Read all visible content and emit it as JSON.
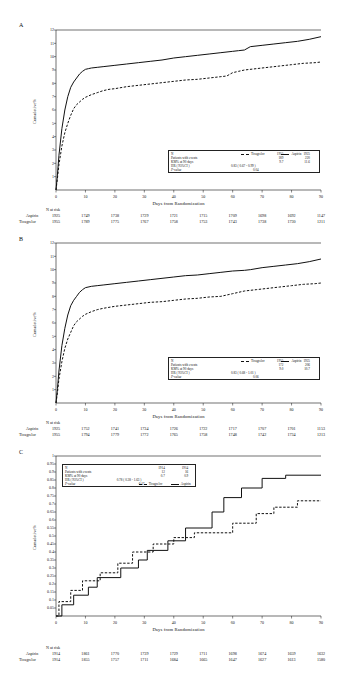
{
  "figure": {
    "xlabel": "Days from Randomization",
    "ylabel": "Cumulative%",
    "risk_header": "N at risk",
    "series_solid": "Aspirin",
    "series_dash": "Ticagrelor",
    "legend_rows": {
      "n": "N",
      "patients": "Patients with events",
      "kmpct": "KM% at 90 days",
      "hr": "HR ( 95%CI )",
      "pvalue": "P-value"
    }
  },
  "panels": [
    {
      "label": "A",
      "yticks": [
        "12",
        "11",
        "10",
        "9",
        "8",
        "7",
        "6",
        "5",
        "4",
        "3",
        "2",
        "1"
      ],
      "xticks": [
        "0",
        "10",
        "20",
        "30",
        "40",
        "50",
        "60",
        "70",
        "80",
        "90"
      ],
      "legend": {
        "n_dash": "1955",
        "n_solid": "1925",
        "events_dash": "189",
        "events_solid": "220",
        "km_dash": "9.7",
        "km_solid": "11.6",
        "hr": "0.83 ( 0.67 - 0.99 )",
        "pvalue": "0.04"
      },
      "risk": {
        "row_solid_label": "Aspirin",
        "row_dash_label": "Ticagrelor",
        "solid": [
          "1925",
          "1749",
          "1738",
          "1729",
          "1721",
          "1715",
          "1709",
          "1698",
          "1692",
          "1147"
        ],
        "dash": [
          "1955",
          "1789",
          "1775",
          "1767",
          "1758",
          "1753",
          "1743",
          "1738",
          "1730",
          "1211"
        ]
      }
    },
    {
      "label": "B",
      "yticks": [
        "12",
        "11",
        "10",
        "9",
        "8",
        "7",
        "6",
        "5",
        "4",
        "3",
        "2",
        "1"
      ],
      "xticks": [
        "0",
        "10",
        "20",
        "30",
        "40",
        "50",
        "60",
        "70",
        "80",
        "90"
      ],
      "legend": {
        "n_dash": "1955",
        "n_solid": "1925",
        "events_dash": "172",
        "events_solid": "206",
        "km_dash": "9.0",
        "km_solid": "10.7",
        "hr": "0.83 ( 0.68 - 1.01 )",
        "pvalue": "0.06"
      },
      "risk": {
        "row_solid_label": "Aspirin",
        "row_dash_label": "Ticagrelor",
        "solid": [
          "1925",
          "1752",
          "1741",
          "1734",
          "1726",
          "1722",
          "1717",
          "1707",
          "1701",
          "1153"
        ],
        "dash": [
          "1955",
          "1794",
          "1779",
          "1772",
          "1765",
          "1758",
          "1748",
          "1742",
          "1734",
          "1213"
        ]
      }
    },
    {
      "label": "C",
      "yticks": [
        "1",
        "0.95",
        "0.9",
        "0.85",
        "0.8",
        "0.75",
        "0.7",
        "0.65",
        "0.6",
        "0.55",
        "0.5",
        "0.45",
        "0.4",
        "0.35",
        "0.3",
        "0.25",
        "0.2",
        "0.15",
        "0.1",
        "0.05"
      ],
      "xticks": [
        "0",
        "10",
        "20",
        "30",
        "40",
        "50",
        "60",
        "70",
        "80",
        "90"
      ],
      "legend": {
        "n_dash": "1914",
        "n_solid": "1914",
        "events_dash": "12",
        "events_solid": "16",
        "km_dash": "0.7",
        "km_solid": "0.9",
        "hr": "0.78 ( 0.38 - 1.63 )",
        "pvalue": "0.47"
      },
      "risk": {
        "row_solid_label": "Aspirin",
        "row_dash_label": "Ticagrelor",
        "solid": [
          "1914",
          "1861",
          "1770",
          "1739",
          "1729",
          "1711",
          "1698",
          "1674",
          "1659",
          "1632"
        ],
        "dash": [
          "1914",
          "1855",
          "1757",
          "1711",
          "1684",
          "1665",
          "1647",
          "1627",
          "1613",
          "1580"
        ]
      }
    }
  ],
  "chart_data": {
    "type": "line",
    "title": "",
    "xlabel": "Days from Randomization",
    "ylabel": "Cumulative%",
    "legend_position": "inside-lower-right",
    "grid": false,
    "panels": [
      {
        "label": "A",
        "xlim": [
          0,
          90
        ],
        "ylim": [
          0,
          12
        ],
        "series": [
          {
            "name": "Aspirin",
            "style": "solid",
            "x": [
              0,
              0.5,
              1,
              2,
              3,
              4,
              5,
              6,
              7,
              8,
              9,
              10,
              11,
              12,
              14,
              16,
              18,
              20,
              24,
              28,
              32,
              36,
              40,
              44,
              48,
              52,
              56,
              60,
              62,
              64,
              66,
              70,
              74,
              78,
              82,
              86,
              90
            ],
            "y": [
              0,
              1.2,
              2.6,
              4.6,
              6.0,
              7.0,
              7.7,
              8.1,
              8.4,
              8.7,
              8.9,
              9.05,
              9.1,
              9.15,
              9.2,
              9.25,
              9.3,
              9.35,
              9.45,
              9.55,
              9.65,
              9.75,
              9.9,
              10.0,
              10.1,
              10.2,
              10.3,
              10.4,
              10.45,
              10.5,
              10.75,
              10.85,
              10.95,
              11.05,
              11.15,
              11.3,
              11.5
            ]
          },
          {
            "name": "Ticagrelor",
            "style": "dashed",
            "x": [
              0,
              0.5,
              1,
              2,
              3,
              4,
              5,
              6,
              7,
              8,
              9,
              10,
              12,
              14,
              16,
              18,
              20,
              24,
              28,
              32,
              36,
              40,
              44,
              48,
              52,
              56,
              58,
              60,
              62,
              64,
              68,
              72,
              76,
              80,
              84,
              88,
              90
            ],
            "y": [
              0,
              0.9,
              1.9,
              3.3,
              4.3,
              5.0,
              5.6,
              6.1,
              6.4,
              6.6,
              6.8,
              6.95,
              7.15,
              7.3,
              7.45,
              7.55,
              7.6,
              7.75,
              7.85,
              7.95,
              8.05,
              8.15,
              8.25,
              8.3,
              8.4,
              8.5,
              8.55,
              8.8,
              8.9,
              9.0,
              9.1,
              9.2,
              9.3,
              9.4,
              9.5,
              9.55,
              9.6
            ]
          }
        ]
      },
      {
        "label": "B",
        "xlim": [
          0,
          90
        ],
        "ylim": [
          0,
          12
        ],
        "series": [
          {
            "name": "Aspirin",
            "style": "solid",
            "x": [
              0,
              0.5,
              1,
              2,
              3,
              4,
              5,
              6,
              7,
              8,
              9,
              10,
              12,
              14,
              16,
              20,
              24,
              28,
              32,
              36,
              40,
              44,
              48,
              52,
              56,
              60,
              64,
              66,
              70,
              74,
              78,
              82,
              86,
              90
            ],
            "y": [
              0,
              1.1,
              2.4,
              4.3,
              5.6,
              6.6,
              7.3,
              7.7,
              8.0,
              8.3,
              8.5,
              8.65,
              8.75,
              8.8,
              8.85,
              8.95,
              9.05,
              9.15,
              9.25,
              9.35,
              9.45,
              9.55,
              9.6,
              9.7,
              9.8,
              9.9,
              9.95,
              10.0,
              10.15,
              10.25,
              10.35,
              10.45,
              10.6,
              10.8
            ]
          },
          {
            "name": "Ticagrelor",
            "style": "dashed",
            "x": [
              0,
              0.5,
              1,
              2,
              3,
              4,
              5,
              6,
              7,
              8,
              9,
              10,
              12,
              14,
              16,
              20,
              24,
              28,
              32,
              36,
              40,
              44,
              48,
              52,
              56,
              60,
              62,
              64,
              68,
              72,
              76,
              80,
              84,
              88,
              90
            ],
            "y": [
              0,
              0.8,
              1.8,
              3.1,
              4.1,
              4.8,
              5.3,
              5.8,
              6.1,
              6.3,
              6.5,
              6.65,
              6.85,
              7.0,
              7.1,
              7.25,
              7.35,
              7.45,
              7.55,
              7.6,
              7.7,
              7.8,
              7.85,
              7.95,
              8.0,
              8.2,
              8.3,
              8.4,
              8.5,
              8.6,
              8.7,
              8.8,
              8.9,
              8.95,
              9.0
            ]
          }
        ]
      },
      {
        "label": "C",
        "xlim": [
          0,
          90
        ],
        "ylim": [
          0,
          1.0
        ],
        "note": "step function, cumulative event percentage",
        "series": [
          {
            "name": "Aspirin",
            "style": "solid-step",
            "x": [
              0,
              2,
              2,
              6,
              6,
              11,
              11,
              14,
              14,
              22,
              22,
              28,
              28,
              31,
              31,
              38,
              38,
              44,
              44,
              53,
              53,
              57,
              57,
              63,
              63,
              70,
              70,
              78,
              78,
              90
            ],
            "y": [
              0,
              0,
              0.07,
              0.07,
              0.13,
              0.13,
              0.18,
              0.18,
              0.24,
              0.24,
              0.3,
              0.3,
              0.35,
              0.35,
              0.41,
              0.41,
              0.47,
              0.47,
              0.55,
              0.55,
              0.65,
              0.65,
              0.74,
              0.74,
              0.8,
              0.8,
              0.86,
              0.86,
              0.88,
              0.88
            ]
          },
          {
            "name": "Ticagrelor",
            "style": "dashed-step",
            "x": [
              0,
              1,
              1,
              5,
              5,
              9,
              9,
              15,
              15,
              21,
              21,
              26,
              26,
              33,
              33,
              40,
              40,
              47,
              47,
              60,
              60,
              68,
              68,
              74,
              74,
              82,
              82,
              90
            ],
            "y": [
              0,
              0,
              0.09,
              0.09,
              0.16,
              0.16,
              0.22,
              0.22,
              0.27,
              0.27,
              0.33,
              0.33,
              0.4,
              0.4,
              0.45,
              0.45,
              0.49,
              0.49,
              0.52,
              0.52,
              0.58,
              0.58,
              0.64,
              0.64,
              0.68,
              0.68,
              0.72,
              0.72
            ]
          }
        ]
      }
    ]
  }
}
